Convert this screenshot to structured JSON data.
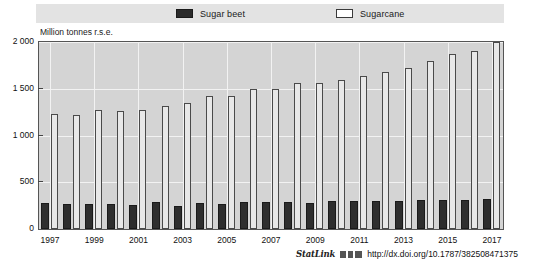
{
  "legend": {
    "items": [
      {
        "label": "Sugar beet",
        "key": "beet",
        "color": "#2e2e2e"
      },
      {
        "label": "Sugarcane",
        "key": "cane",
        "color": "#ffffff"
      }
    ]
  },
  "footer": {
    "statlink_label": "StatLink",
    "statlink_icon": "barcode-icon",
    "url": "http://dx.doi.org/10.1787/382508471375"
  },
  "chart_data": {
    "type": "bar",
    "title": "",
    "subtitle": "",
    "xlabel": "",
    "ylabel": "Million tonnes r.s.e.",
    "ylim": [
      0,
      2000
    ],
    "yticks": [
      0,
      500,
      1000,
      1500,
      2000
    ],
    "ytick_labels": [
      "0",
      "500",
      "1 000",
      "1 500",
      "2 000"
    ],
    "grid": true,
    "legend_position": "top",
    "categories": [
      "1997",
      "1998",
      "1999",
      "2000",
      "2001",
      "2002",
      "2003",
      "2004",
      "2005",
      "2006",
      "2007",
      "2008",
      "2009",
      "2010",
      "2011",
      "2012",
      "2013",
      "2014",
      "2015",
      "2016",
      "2017"
    ],
    "xtick_labels": [
      "1997",
      "1999",
      "2001",
      "2003",
      "2005",
      "2007",
      "2009",
      "2011",
      "2013",
      "2015",
      "2017"
    ],
    "series": [
      {
        "name": "Sugar beet",
        "color": "#2e2e2e",
        "values": [
          280,
          270,
          265,
          270,
          255,
          285,
          250,
          280,
          265,
          285,
          290,
          285,
          280,
          295,
          300,
          300,
          300,
          305,
          310,
          315,
          320
        ]
      },
      {
        "name": "Sugarcane",
        "color": "#e8e8e8",
        "values": [
          1230,
          1215,
          1270,
          1265,
          1270,
          1320,
          1345,
          1425,
          1420,
          1500,
          1500,
          1565,
          1565,
          1590,
          1640,
          1680,
          1725,
          1800,
          1870,
          1900,
          2000
        ]
      }
    ]
  }
}
